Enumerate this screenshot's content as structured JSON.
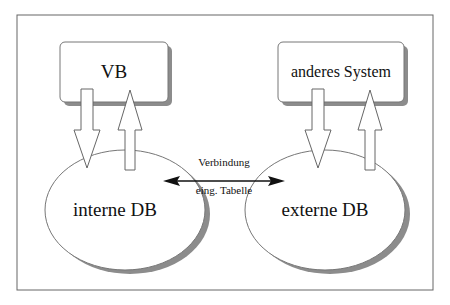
{
  "diagram": {
    "nodes": {
      "vb": {
        "label": "VB",
        "shape": "rounded-rect"
      },
      "anderes_system": {
        "label": "anderes System",
        "shape": "rounded-rect"
      },
      "interne_db": {
        "label": "interne DB",
        "shape": "ellipse"
      },
      "externe_db": {
        "label": "externe DB",
        "shape": "ellipse"
      }
    },
    "edges": [
      {
        "from": "vb",
        "to": "interne_db",
        "style": "hollow-block-arrow"
      },
      {
        "from": "interne_db",
        "to": "vb",
        "style": "hollow-block-arrow"
      },
      {
        "from": "anderes_system",
        "to": "externe_db",
        "style": "hollow-block-arrow"
      },
      {
        "from": "externe_db",
        "to": "anderes_system",
        "style": "hollow-block-arrow"
      },
      {
        "from": "interne_db",
        "to": "externe_db",
        "style": "double-headed-line",
        "label_above": "Verbindung",
        "label_below": "eing. Tabelle"
      }
    ],
    "colors": {
      "stroke": "#555555",
      "shadow": "#8c8c8c",
      "fill": "#ffffff",
      "frame": "#555555"
    }
  }
}
